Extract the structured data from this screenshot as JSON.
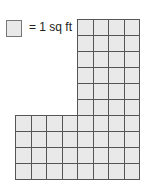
{
  "legend": {
    "label": "= 1 sq ft",
    "unit_icon": "unit-square-icon"
  },
  "figure": {
    "top_section": {
      "columns": 4,
      "rows": 6
    },
    "bottom_section": {
      "columns": 8,
      "rows": 4
    },
    "total_squares": 56,
    "colors": {
      "fill": "#e9e9e9",
      "line": "#555555"
    }
  }
}
